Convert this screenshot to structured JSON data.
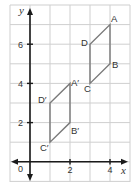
{
  "diagram": {
    "type": "coordinate-grid-translation",
    "axes": {
      "x_label": "x",
      "y_label": "y",
      "origin_label": "0",
      "x_ticks": [
        {
          "value": 2,
          "label": "2"
        },
        {
          "value": 4,
          "label": "4"
        }
      ],
      "y_ticks": [
        {
          "value": 2,
          "label": "2"
        },
        {
          "value": 4,
          "label": "4"
        },
        {
          "value": 6,
          "label": "6"
        }
      ],
      "x_range": [
        -1,
        5
      ],
      "y_range": [
        -1,
        8
      ],
      "grid": true
    },
    "shapes": [
      {
        "name": "ABCD",
        "vertices": [
          {
            "label": "A",
            "x": 4,
            "y": 7
          },
          {
            "label": "B",
            "x": 4,
            "y": 5
          },
          {
            "label": "C",
            "x": 3,
            "y": 4
          },
          {
            "label": "D",
            "x": 3,
            "y": 6
          }
        ]
      },
      {
        "name": "A'B'C'D'",
        "vertices": [
          {
            "label": "A′",
            "x": 2,
            "y": 4
          },
          {
            "label": "B′",
            "x": 2,
            "y": 2
          },
          {
            "label": "C′",
            "x": 1,
            "y": 1
          },
          {
            "label": "D′",
            "x": 1,
            "y": 3
          }
        ]
      }
    ],
    "colors": {
      "grid": "#cfcfcf",
      "axis": "#1a1a1a",
      "shape_stroke": "#7a7a7a",
      "text": "#333333"
    }
  }
}
